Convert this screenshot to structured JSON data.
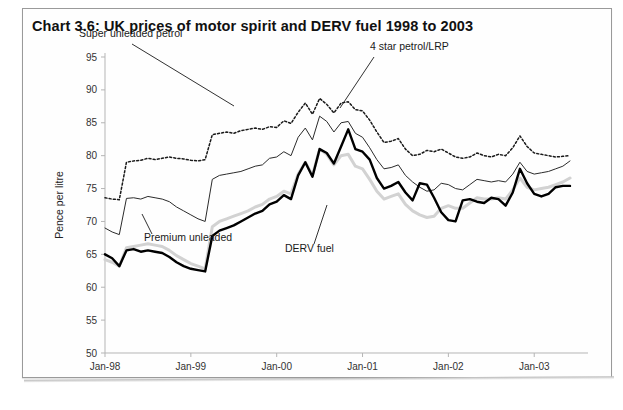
{
  "title": "Chart 3.6:  UK prices of motor spirit and DERV fuel 1998 to 2003",
  "axes": {
    "ylabel": "Pence per litre",
    "yticks": [
      "95",
      "90",
      "85",
      "80",
      "75",
      "70",
      "65",
      "60",
      "55",
      "50"
    ],
    "xticks": [
      "Jan-98",
      "Jan-99",
      "Jan-00",
      "Jan-01",
      "Jan-02",
      "Jan-03"
    ]
  },
  "annotations": {
    "super": "Super unleaded petrol",
    "fourstar": "4 star petrol/LRP",
    "premium": "Premium unleaded",
    "derv": "DERV fuel"
  },
  "colors": {
    "super": "#1a1a1a",
    "fourstar": "#2b2b2b",
    "premium": "#d2d2d2",
    "derv": "#000000",
    "axis": "#b5b5b5",
    "text": "#111111"
  },
  "chart_data": {
    "type": "line",
    "title": "Chart 3.6:  UK prices of motor spirit and DERV fuel 1998 to 2003",
    "xlabel": "",
    "ylabel": "Pence per litre",
    "ylim": [
      50,
      95
    ],
    "ytick_step": 5,
    "grid": false,
    "legend": "inline-annotations",
    "x_tick_labels": [
      "Jan-98",
      "Jan-99",
      "Jan-00",
      "Jan-01",
      "Jan-02",
      "Jan-03"
    ],
    "x_tick_index": [
      0,
      12,
      24,
      36,
      48,
      60
    ],
    "x_count": 66,
    "series": [
      {
        "name": "Super unleaded petrol",
        "style": "dotted",
        "values": [
          73.6,
          73.4,
          73.3,
          79.0,
          79.2,
          79.3,
          79.6,
          79.4,
          79.6,
          79.8,
          79.6,
          79.5,
          79.3,
          79.2,
          79.4,
          83.2,
          83.4,
          83.6,
          83.4,
          83.8,
          84.0,
          84.2,
          84.0,
          84.4,
          84.3,
          85.3,
          84.9,
          86.6,
          88.0,
          86.3,
          88.7,
          87.8,
          86.5,
          88.0,
          88.2,
          87.0,
          86.8,
          85.4,
          83.6,
          82.0,
          82.2,
          82.6,
          81.0,
          80.0,
          80.2,
          80.8,
          80.6,
          81.0,
          80.4,
          79.8,
          79.6,
          79.8,
          80.4,
          80.0,
          79.8,
          80.2,
          80.0,
          81.2,
          83.0,
          81.4,
          80.4,
          80.2,
          80.0,
          79.8,
          79.9,
          80.0
        ]
      },
      {
        "name": "4 star petrol/LRP",
        "style": "thin-solid",
        "values": [
          69.0,
          68.4,
          68.0,
          73.5,
          73.6,
          73.4,
          73.8,
          73.6,
          73.4,
          73.0,
          72.2,
          71.6,
          71.0,
          70.4,
          70.0,
          76.4,
          77.0,
          77.2,
          77.4,
          77.6,
          78.0,
          78.4,
          78.6,
          79.6,
          79.8,
          80.6,
          80.0,
          82.8,
          84.2,
          82.4,
          86.0,
          85.2,
          83.6,
          85.0,
          85.2,
          83.4,
          82.8,
          81.2,
          79.4,
          78.0,
          78.2,
          78.6,
          77.0,
          76.0,
          75.2,
          74.6,
          74.8,
          75.8,
          75.6,
          75.0,
          74.8,
          75.6,
          76.4,
          76.2,
          76.0,
          76.2,
          76.0,
          77.2,
          79.0,
          77.6,
          77.2,
          77.4,
          77.6,
          78.0,
          78.4,
          79.2
        ]
      },
      {
        "name": "Premium unleaded",
        "style": "thick-grey",
        "values": [
          64.2,
          63.8,
          63.2,
          66.0,
          66.2,
          66.4,
          66.6,
          66.4,
          66.2,
          65.6,
          64.8,
          64.2,
          63.6,
          63.2,
          62.8,
          69.2,
          70.0,
          70.4,
          70.8,
          71.2,
          71.6,
          72.2,
          72.6,
          73.4,
          73.8,
          74.6,
          74.2,
          77.2,
          79.0,
          77.0,
          81.0,
          80.2,
          78.6,
          80.0,
          80.2,
          78.4,
          78.0,
          76.4,
          74.6,
          73.4,
          73.8,
          74.2,
          72.6,
          71.6,
          71.0,
          70.6,
          70.8,
          72.0,
          72.4,
          72.0,
          72.0,
          72.8,
          73.6,
          73.4,
          73.4,
          73.6,
          73.4,
          74.8,
          76.6,
          75.2,
          74.8,
          75.0,
          75.2,
          75.6,
          76.0,
          76.6
        ]
      },
      {
        "name": "DERV fuel",
        "style": "thick-black",
        "values": [
          65.0,
          64.4,
          63.2,
          65.6,
          65.8,
          65.4,
          65.6,
          65.4,
          65.2,
          64.6,
          63.8,
          63.2,
          62.8,
          62.6,
          62.4,
          67.8,
          68.6,
          69.0,
          69.4,
          70.0,
          70.6,
          71.2,
          71.6,
          72.6,
          73.0,
          74.0,
          73.4,
          77.0,
          79.0,
          76.8,
          81.0,
          80.4,
          78.8,
          81.4,
          84.0,
          81.0,
          80.6,
          79.4,
          76.6,
          75.0,
          75.4,
          76.0,
          74.4,
          73.2,
          75.8,
          75.6,
          73.6,
          71.4,
          70.2,
          70.0,
          73.2,
          73.4,
          73.0,
          72.8,
          73.6,
          73.4,
          72.4,
          74.4,
          78.0,
          75.8,
          74.2,
          73.8,
          74.2,
          75.2,
          75.4,
          75.4
        ]
      }
    ]
  }
}
